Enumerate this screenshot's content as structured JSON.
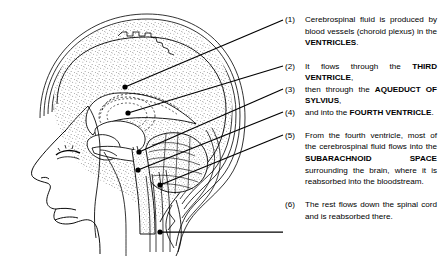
{
  "figure": {
    "type": "labeled-anatomical-diagram"
  },
  "diagram": {
    "parts": [
      "scalp",
      "skull",
      "dura-mater",
      "arachnoid",
      "subarachnoid-space",
      "cerebrum",
      "corpus-callosum",
      "lateral-ventricle",
      "third-ventricle",
      "aqueduct-of-sylvius",
      "fourth-ventricle",
      "cerebellum",
      "brainstem",
      "spinal-cord",
      "face-profile"
    ],
    "stipple_color": "#000000",
    "line_color": "#000000",
    "background": "#ffffff"
  },
  "legend": {
    "items": [
      {
        "num": "(1)",
        "segments": [
          {
            "t": "Cerebrospinal fluid is produced by blood vessels (choroid plexus) in the ",
            "b": false
          },
          {
            "t": "VENTRICLES",
            "b": true
          },
          {
            "t": ".",
            "b": false
          }
        ],
        "anchor": {
          "x": 125,
          "y": 87
        }
      },
      {
        "num": "(2)",
        "segments": [
          {
            "t": "It flows through the ",
            "b": false
          },
          {
            "t": "THIRD VENTRICLE",
            "b": true
          },
          {
            "t": ",",
            "b": false
          }
        ],
        "anchor": {
          "x": 128,
          "y": 113
        }
      },
      {
        "num": "(3)",
        "segments": [
          {
            "t": "then through the ",
            "b": false
          },
          {
            "t": "AQUEDUCT OF SYLVIUS",
            "b": true
          },
          {
            "t": ",",
            "b": false
          }
        ],
        "anchor": {
          "x": 139,
          "y": 152
        }
      },
      {
        "num": "(4)",
        "segments": [
          {
            "t": "and into the ",
            "b": false
          },
          {
            "t": "FOURTH VENTRICLE",
            "b": true
          },
          {
            "t": ".",
            "b": false
          }
        ],
        "anchor": {
          "x": 138,
          "y": 170
        }
      },
      {
        "num": "(5)",
        "segments": [
          {
            "t": "From the fourth ventricle, most of the cerebrospinal fluid flows into the ",
            "b": false
          },
          {
            "t": "SUBARACHNOID SPACE",
            "b": true
          },
          {
            "t": " surrounding the brain, where it is reabsorbed into the bloodstream.",
            "b": false
          }
        ],
        "anchor": {
          "x": 160,
          "y": 185
        }
      },
      {
        "num": "(6)",
        "segments": [
          {
            "t": "The rest flows down the spinal cord and is reabsorbed there.",
            "b": false
          }
        ],
        "anchor": {
          "x": 160,
          "y": 232
        }
      }
    ]
  }
}
